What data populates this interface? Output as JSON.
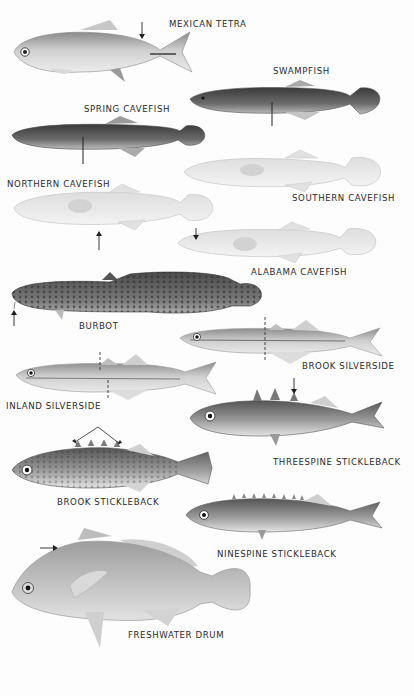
{
  "plate": {
    "background": "#fdfdfd",
    "label_color": "#2b2b2b",
    "species": [
      {
        "id": "mexican-tetra",
        "label": "MEXICAN TETRA",
        "label_pos": [
          169,
          19
        ],
        "marker": "down-arrow on back"
      },
      {
        "id": "swampfish",
        "label": "SWAMPFISH",
        "label_pos": [
          273,
          68
        ],
        "marker": "vertical line below body"
      },
      {
        "id": "spring-cavefish",
        "label": "SPRING CAVEFISH",
        "label_pos": [
          84,
          106
        ],
        "marker": "vertical line below body"
      },
      {
        "id": "northern-cavefish",
        "label": "NORTHERN CAVEFISH",
        "label_pos": [
          7,
          181
        ],
        "marker": "up-arrow below belly"
      },
      {
        "id": "southern-cavefish",
        "label": "SOUTHERN CAVEFISH",
        "label_pos": [
          292,
          195
        ],
        "marker": ""
      },
      {
        "id": "alabama-cavefish",
        "label": "ALABAMA CAVEFISH",
        "label_pos": [
          251,
          268
        ],
        "marker": "down-arrow on head"
      },
      {
        "id": "burbot",
        "label": "BURBOT",
        "label_pos": [
          79,
          323
        ],
        "marker": "up-arrow at chin barbel"
      },
      {
        "id": "brook-silverside",
        "label": "BROOK SILVERSIDE",
        "label_pos": [
          302,
          360
        ],
        "marker": "dashed vertical line"
      },
      {
        "id": "inland-silverside",
        "label": "INLAND SILVERSIDE",
        "label_pos": [
          6,
          403
        ],
        "marker": "dashed vertical lines"
      },
      {
        "id": "threespine-stickleback",
        "label": "THREESPINE STICKLEBACK",
        "label_pos": [
          273,
          458
        ],
        "marker": "down-arrow on third spine"
      },
      {
        "id": "brook-stickleback",
        "label": "BROOK STICKLEBACK",
        "label_pos": [
          57,
          497
        ],
        "marker": "bracket arrows over spines"
      },
      {
        "id": "ninespine-stickleback",
        "label": "NINESPINE STICKLEBACK",
        "label_pos": [
          217,
          550
        ],
        "marker": ""
      },
      {
        "id": "freshwater-drum",
        "label": "FRESHWATER DRUM",
        "label_pos": [
          128,
          631
        ],
        "marker": "right-arrow at nape"
      }
    ]
  }
}
